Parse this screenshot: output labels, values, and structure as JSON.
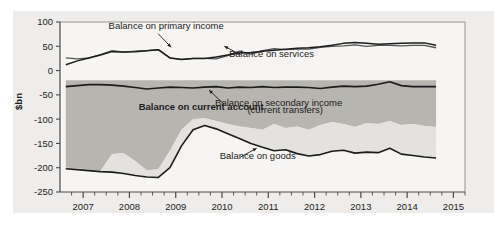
{
  "chart_data": {
    "type": "area",
    "title": "",
    "subtitle": "",
    "xlabel": "",
    "ylabel": "$bn",
    "ylim": [
      -250,
      100
    ],
    "xlim": [
      2006.5,
      2015.25
    ],
    "grid": false,
    "legend_position": "inline-annotations",
    "y_ticks": [
      "100",
      "50",
      "0",
      "-50",
      "-100",
      "-150",
      "-200",
      "-250"
    ],
    "y_tick_values": [
      100,
      50,
      0,
      -50,
      -100,
      -150,
      -200,
      -250
    ],
    "x_ticks": [
      "2007",
      "2008",
      "2009",
      "2010",
      "2011",
      "2012",
      "2013",
      "2014",
      "2015"
    ],
    "x_tick_values": [
      2007,
      2008,
      2009,
      2010,
      2011,
      2012,
      2013,
      2014,
      2015
    ],
    "minor_tick_interval_years": 0.25,
    "annotations": [
      {
        "name": "balance-on-primary-income",
        "text": "Balance on primary income",
        "x": 2007.55,
        "y": 86
      },
      {
        "name": "balance-on-services",
        "text": "Balance on services",
        "x": 2010.15,
        "y": 27
      },
      {
        "name": "balance-on-current-account",
        "text": "Balance on current account",
        "x": 2008.2,
        "y": -82
      },
      {
        "name": "balance-on-secondary-income",
        "text": "Balance on secondary income",
        "x": 2009.85,
        "y": -72
      },
      {
        "name": "balance-on-secondary-income-sub",
        "text": "(current transfers)",
        "x": 2010.55,
        "y": -88
      },
      {
        "name": "balance-on-goods",
        "text": "Balance on goods",
        "x": 2009.95,
        "y": -183
      }
    ],
    "x": [
      2006.625,
      2006.875,
      2007.125,
      2007.375,
      2007.625,
      2007.875,
      2008.125,
      2008.375,
      2008.625,
      2008.875,
      2009.125,
      2009.375,
      2009.625,
      2009.875,
      2010.125,
      2010.375,
      2010.625,
      2010.875,
      2011.125,
      2011.375,
      2011.625,
      2011.875,
      2012.125,
      2012.375,
      2012.625,
      2012.875,
      2013.125,
      2013.375,
      2013.625,
      2013.875,
      2014.125,
      2014.375,
      2014.625
    ],
    "series": [
      {
        "name": "Balance on primary income",
        "color": "#4a4a4a",
        "values": [
          26,
          24,
          26,
          33,
          41,
          38,
          40,
          41,
          43,
          26,
          23,
          25,
          25,
          24,
          31,
          40,
          34,
          41,
          45,
          43,
          44,
          44,
          48,
          50,
          51,
          53,
          50,
          52,
          52,
          51,
          52,
          52,
          47
        ]
      },
      {
        "name": "Balance on services",
        "color": "#2b2b2b",
        "values": [
          12,
          20,
          26,
          32,
          39,
          38,
          39,
          41,
          43,
          26,
          23,
          25,
          25,
          28,
          32,
          36,
          37,
          40,
          42,
          44,
          46,
          47,
          49,
          52,
          56,
          58,
          56,
          54,
          55,
          56,
          57,
          57,
          52
        ]
      },
      {
        "name": "Balance on secondary income",
        "color": "#1c1c1c",
        "values": [
          -33,
          -31,
          -29,
          -29,
          -30,
          -32,
          -35,
          -38,
          -36,
          -34,
          -35,
          -36,
          -34,
          -33,
          -36,
          -34,
          -35,
          -33,
          -35,
          -34,
          -34,
          -35,
          -37,
          -34,
          -32,
          -33,
          -32,
          -28,
          -23,
          -31,
          -33,
          -33,
          -33
        ]
      },
      {
        "name": "Balance on goods",
        "color": "#1c1c1c",
        "values": [
          -202,
          -204,
          -206,
          -208,
          -209,
          -212,
          -216,
          -219,
          -220,
          -200,
          -155,
          -122,
          -113,
          -120,
          -130,
          -140,
          -150,
          -158,
          -165,
          -163,
          -171,
          -176,
          -173,
          -166,
          -164,
          -170,
          -168,
          -169,
          -160,
          -172,
          -175,
          -178,
          -180
        ]
      },
      {
        "name": "Current account band upper",
        "color": "#b7b5b0",
        "values": [
          -20,
          -20,
          -20,
          -20,
          -20,
          -20,
          -20,
          -20,
          -20,
          -20,
          -20,
          -20,
          -20,
          -20,
          -20,
          -20,
          -20,
          -20,
          -20,
          -20,
          -20,
          -20,
          -20,
          -20,
          -20,
          -20,
          -20,
          -20,
          -20,
          -20,
          -20,
          -20,
          -20
        ]
      },
      {
        "name": "Current account band lower",
        "color": "#b7b5b0",
        "values": [
          -200,
          -201,
          -204,
          -207,
          -172,
          -170,
          -186,
          -205,
          -203,
          -165,
          -122,
          -100,
          -98,
          -104,
          -110,
          -115,
          -118,
          -122,
          -110,
          -118,
          -115,
          -122,
          -112,
          -106,
          -110,
          -116,
          -108,
          -110,
          -104,
          -112,
          -110,
          -114,
          -116
        ]
      }
    ],
    "colors": {
      "panel_background": "#eeedeb",
      "plot_background": "#f6f5f3",
      "band_dark": "#b7b5b0",
      "band_light": "#e3e2de",
      "line_dark": "#1c1c1c",
      "line_gray": "#555555",
      "axis": "#4a4a4a",
      "text": "#1c1c1c"
    }
  }
}
